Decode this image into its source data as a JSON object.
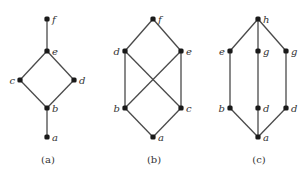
{
  "figure": {
    "diagrams": [
      {
        "id": "a",
        "caption": "(a)",
        "caption_pos": [
          48,
          163
        ],
        "nodes": [
          {
            "key": "f",
            "label": "f",
            "x": 47,
            "y": 19,
            "label_side": "right"
          },
          {
            "key": "e",
            "label": "e",
            "x": 47,
            "y": 51,
            "label_side": "right"
          },
          {
            "key": "c",
            "label": "c",
            "x": 20,
            "y": 80,
            "label_side": "left"
          },
          {
            "key": "d",
            "label": "d",
            "x": 74,
            "y": 80,
            "label_side": "right"
          },
          {
            "key": "b",
            "label": "b",
            "x": 47,
            "y": 108,
            "label_side": "right"
          },
          {
            "key": "a",
            "label": "a",
            "x": 47,
            "y": 137,
            "label_side": "right"
          }
        ],
        "edges": [
          [
            "f",
            "e"
          ],
          [
            "e",
            "c"
          ],
          [
            "e",
            "d"
          ],
          [
            "c",
            "b"
          ],
          [
            "d",
            "b"
          ],
          [
            "b",
            "a"
          ]
        ]
      },
      {
        "id": "b",
        "caption": "(b)",
        "caption_pos": [
          154,
          163
        ],
        "nodes": [
          {
            "key": "f",
            "label": "f",
            "x": 153,
            "y": 19,
            "label_side": "right"
          },
          {
            "key": "d",
            "label": "d",
            "x": 125,
            "y": 51,
            "label_side": "left"
          },
          {
            "key": "e",
            "label": "e",
            "x": 181,
            "y": 51,
            "label_side": "right"
          },
          {
            "key": "b",
            "label": "b",
            "x": 125,
            "y": 108,
            "label_side": "left"
          },
          {
            "key": "c",
            "label": "c",
            "x": 181,
            "y": 108,
            "label_side": "right"
          },
          {
            "key": "a",
            "label": "a",
            "x": 153,
            "y": 137,
            "label_side": "right"
          }
        ],
        "edges": [
          [
            "f",
            "d"
          ],
          [
            "f",
            "e"
          ],
          [
            "d",
            "b"
          ],
          [
            "d",
            "c"
          ],
          [
            "e",
            "b"
          ],
          [
            "e",
            "c"
          ],
          [
            "b",
            "a"
          ],
          [
            "c",
            "a"
          ]
        ]
      },
      {
        "id": "c",
        "caption": "(c)",
        "caption_pos": [
          259,
          163
        ],
        "nodes": [
          {
            "key": "h",
            "label": "h",
            "x": 258,
            "y": 19,
            "label_side": "right"
          },
          {
            "key": "e",
            "label": "e",
            "x": 230,
            "y": 51,
            "label_side": "left"
          },
          {
            "key": "g1",
            "label": "g",
            "x": 258,
            "y": 51,
            "label_side": "right"
          },
          {
            "key": "g2",
            "label": "g",
            "x": 286,
            "y": 51,
            "label_side": "right"
          },
          {
            "key": "b",
            "label": "b",
            "x": 230,
            "y": 108,
            "label_side": "left"
          },
          {
            "key": "d1",
            "label": "d",
            "x": 258,
            "y": 108,
            "label_side": "right"
          },
          {
            "key": "d2",
            "label": "d",
            "x": 286,
            "y": 108,
            "label_side": "right"
          },
          {
            "key": "a",
            "label": "a",
            "x": 258,
            "y": 137,
            "label_side": "right"
          }
        ],
        "edges": [
          [
            "h",
            "e"
          ],
          [
            "h",
            "g1"
          ],
          [
            "h",
            "g2"
          ],
          [
            "e",
            "b"
          ],
          [
            "g1",
            "d1"
          ],
          [
            "g2",
            "d2"
          ],
          [
            "b",
            "a"
          ],
          [
            "d1",
            "a"
          ],
          [
            "d2",
            "a"
          ]
        ]
      }
    ]
  }
}
